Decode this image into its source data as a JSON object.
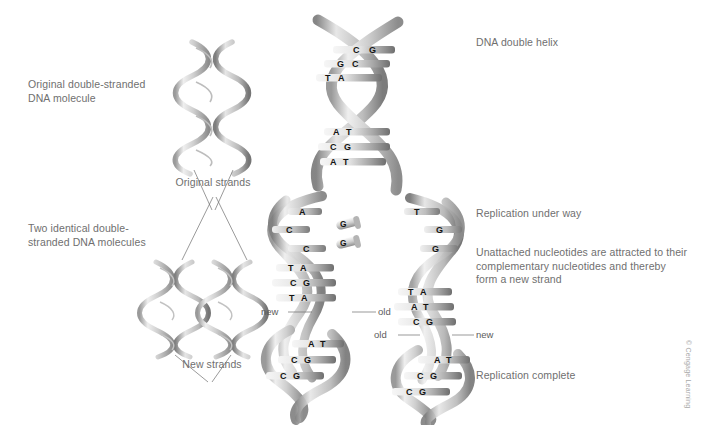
{
  "figure": {
    "credit": "© Cengage Learning"
  },
  "left_labels": {
    "original_molecule": "Original double-stranded\nDNA molecule",
    "two_molecules": "Two identical double-\nstranded DNA molecules",
    "original_strands": "Original strands",
    "new_strands": "New strands"
  },
  "right_labels": {
    "double_helix": "DNA double helix",
    "replication_under_way": "Replication under way",
    "nucleotide_note": "Unattached nucleotides are attracted to their\ncomplementary nucleotides and thereby\nform a new strand",
    "replication_complete": "Replication complete"
  },
  "fork_labels": {
    "left_new": "new",
    "left_old": "old",
    "right_old": "old",
    "right_new": "new"
  },
  "base_pairs": {
    "helix_top_upper": [
      {
        "left": "C",
        "right": "G"
      },
      {
        "left": "G",
        "right": "C"
      },
      {
        "left": "T",
        "right": "A"
      }
    ],
    "helix_top_lower": [
      {
        "left": "A",
        "right": "T"
      },
      {
        "left": "C",
        "right": "G"
      },
      {
        "left": "A",
        "right": "T"
      }
    ],
    "fork_left_unpaired": [
      "A",
      "C",
      "C"
    ],
    "fork_right_unpaired": [
      "T",
      "G",
      "G"
    ],
    "free_nucleotides": [
      "G",
      "G"
    ],
    "fork_left_paired": [
      {
        "left": "T",
        "right": "A"
      },
      {
        "left": "C",
        "right": "G"
      },
      {
        "left": "T",
        "right": "A"
      }
    ],
    "fork_right_paired": [
      {
        "left": "T",
        "right": "A"
      },
      {
        "left": "A",
        "right": "T"
      },
      {
        "left": "C",
        "right": "G"
      }
    ],
    "daughter_left_bottom": [
      {
        "left": "A",
        "right": "T"
      },
      {
        "left": "C",
        "right": "G"
      },
      {
        "left": "C",
        "right": "G"
      }
    ],
    "daughter_right_bottom": [
      {
        "left": "A",
        "right": "T"
      },
      {
        "left": "C",
        "right": "G"
      },
      {
        "left": "C",
        "right": "G"
      }
    ]
  },
  "colors": {
    "text": "#6f6f6f",
    "base_text": "#141414",
    "ribbon_light": "#f2f2f2",
    "ribbon_mid": "#c9c9c9",
    "ribbon_dark": "#8a8a8a",
    "background": "#ffffff"
  }
}
